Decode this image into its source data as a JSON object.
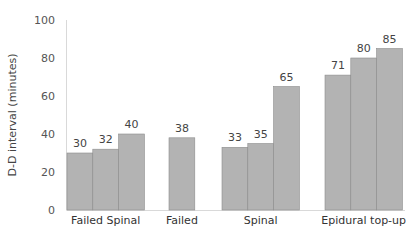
{
  "chart_data": {
    "type": "bar",
    "title": "",
    "xlabel": "",
    "ylabel": "D-D interval (minutes)",
    "ylim": [
      0,
      100
    ],
    "yticks": [
      0,
      20,
      40,
      60,
      80,
      100
    ],
    "grid": false,
    "legend": null,
    "categories": [
      "Failed Spinal",
      "Failed",
      "Spinal",
      "Epidural top-up"
    ],
    "groups": [
      {
        "category": "Failed Spinal",
        "values": [
          30,
          32,
          40
        ]
      },
      {
        "category": "Failed",
        "values": [
          38
        ]
      },
      {
        "category": "Spinal",
        "values": [
          33,
          35,
          65
        ]
      },
      {
        "category": "Epidural top-up",
        "values": [
          71,
          80,
          85
        ]
      }
    ],
    "colors": {
      "bar": "#b3b3b3",
      "bar_edge": "#8c8c8c",
      "axis": "#d9d9d9"
    }
  }
}
